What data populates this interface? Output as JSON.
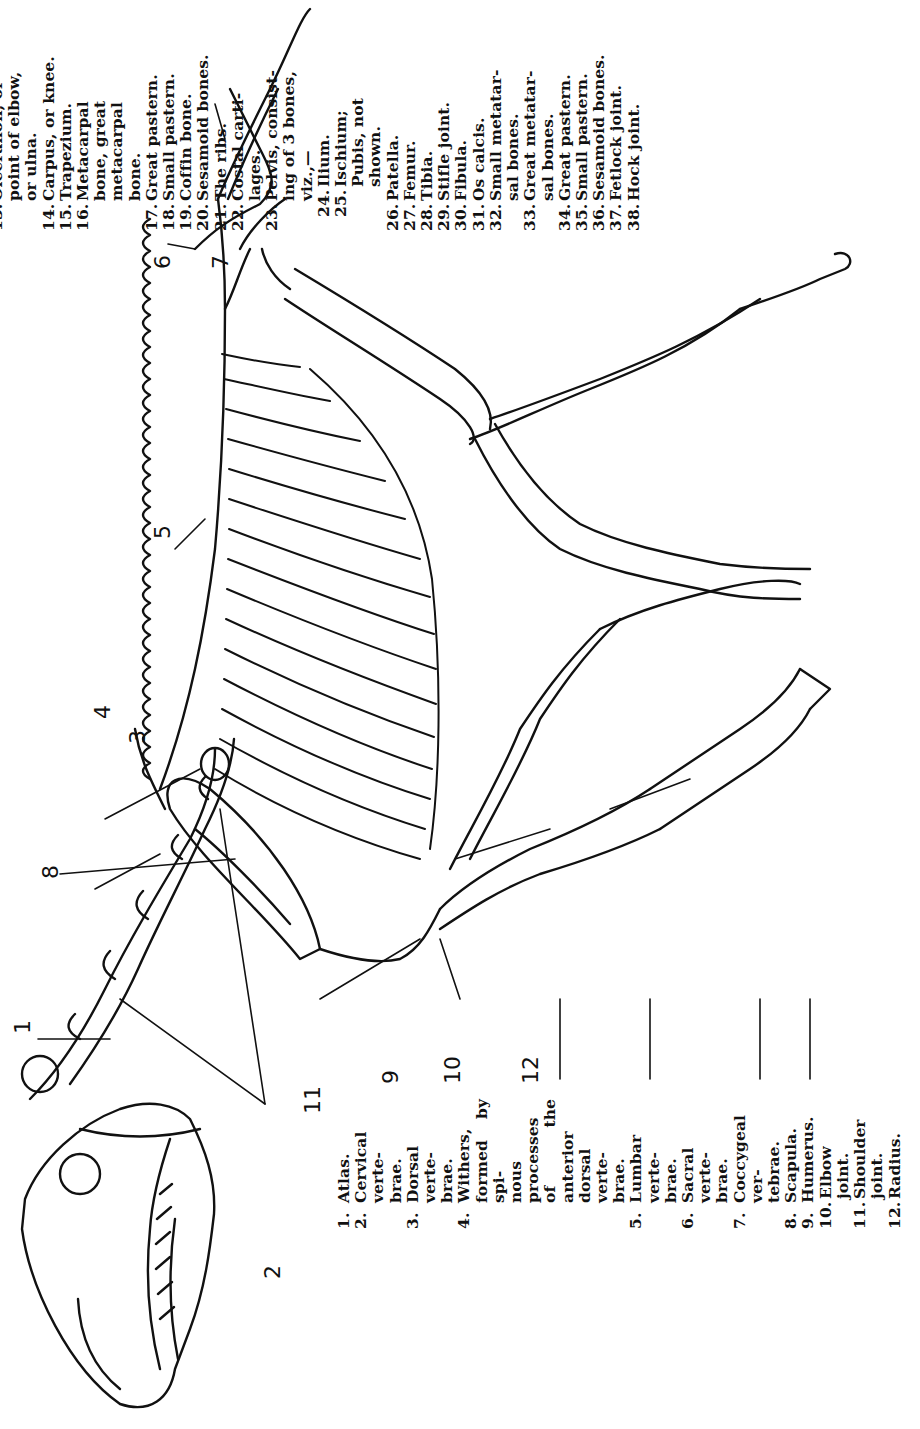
{
  "figure": {
    "orientation": "rotated 90 degrees counter-clockwise",
    "callout_labels": [
      "1",
      "2",
      "2",
      "3",
      "4",
      "5",
      "6",
      "7",
      "8",
      "9",
      "10",
      "11",
      "12",
      "13",
      "14",
      "15",
      "16",
      "17",
      "18",
      "19",
      "20",
      "21",
      "21",
      "22",
      "23",
      "23",
      "24",
      "25",
      "26",
      "27",
      "28",
      "29",
      "30",
      "31",
      "32",
      "33",
      "34",
      "35",
      "36",
      "37",
      "38"
    ]
  },
  "legend_left": [
    {
      "num": "1.",
      "text": "Atlas."
    },
    {
      "num": "2.",
      "text": "Cervical verte-",
      "cont": [
        "brae."
      ]
    },
    {
      "num": "3.",
      "text": "Dorsal verte-",
      "cont": [
        "brae."
      ]
    },
    {
      "num": "4.",
      "text": "Withers,",
      "cont": [
        "formed by spi-",
        "nous processes",
        "of the anterior",
        "dorsal verte-",
        "brae."
      ]
    },
    {
      "num": "5.",
      "text": "Lumbar verte-",
      "cont": [
        "brae."
      ]
    },
    {
      "num": "6.",
      "text": "Sacral verte-",
      "cont": [
        "brae."
      ]
    },
    {
      "num": "7.",
      "text": "Coccygeal ver-",
      "cont": [
        "tebrae."
      ]
    },
    {
      "num": "8.",
      "text": "Scapula."
    },
    {
      "num": "9.",
      "text": "Humerus."
    },
    {
      "num": "10.",
      "text": "Elbow joint."
    },
    {
      "num": "11.",
      "text": "Shoulder joint."
    },
    {
      "num": "12.",
      "text": "Radius."
    }
  ],
  "legend_right": [
    {
      "num": "13.",
      "text": "Olecranon, or",
      "cont": [
        "point of elbow,",
        "or ulna."
      ]
    },
    {
      "num": "14.",
      "text": "Carpus, or knee."
    },
    {
      "num": "15.",
      "text": "Trapezium."
    },
    {
      "num": "16.",
      "text": "Metacarpal",
      "cont": [
        "bone, great",
        "metacarpal",
        "bone."
      ]
    },
    {
      "num": "17.",
      "text": "Great pastern."
    },
    {
      "num": "18.",
      "text": "Small pastern."
    },
    {
      "num": "19.",
      "text": "Coffin bone."
    },
    {
      "num": "20.",
      "text": "Sesamoid bones."
    },
    {
      "num": "21.",
      "text": "The ribs."
    },
    {
      "num": "22.",
      "text": "Costal carti-",
      "cont": [
        "lages."
      ]
    },
    {
      "num": "23.",
      "text": "Pelvis, consist-",
      "cont": [
        "ing of 3 bones,",
        "viz.,—"
      ]
    },
    {
      "num": "24.",
      "text": "Ilium.",
      "sub": true
    },
    {
      "num": "25.",
      "text": "Ischium;",
      "sub": true,
      "cont": [
        "Pubis, not",
        "shown."
      ]
    },
    {
      "num": "26.",
      "text": "Patella."
    },
    {
      "num": "27.",
      "text": "Femur."
    },
    {
      "num": "28.",
      "text": "Tibia."
    },
    {
      "num": "29.",
      "text": "Stifle joint."
    },
    {
      "num": "30.",
      "text": "Fibula."
    },
    {
      "num": "31.",
      "text": "Os calcis."
    },
    {
      "num": "32.",
      "text": "Small metatar-",
      "cont": [
        "sal bones."
      ]
    },
    {
      "num": "33.",
      "text": "Great metatar-",
      "cont": [
        "sal bones."
      ]
    },
    {
      "num": "34.",
      "text": "Great pastern."
    },
    {
      "num": "35.",
      "text": "Small pastern."
    },
    {
      "num": "36.",
      "text": "Sesamoid bones."
    },
    {
      "num": "37.",
      "text": "Fetlock joint."
    },
    {
      "num": "38.",
      "text": "Hock joint."
    }
  ]
}
